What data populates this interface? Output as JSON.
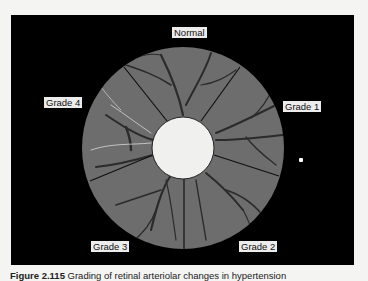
{
  "figure": {
    "segments": [
      {
        "label": "Normal"
      },
      {
        "label": "Grade 1"
      },
      {
        "label": "Grade 2"
      },
      {
        "label": "Grade 3"
      },
      {
        "label": "Grade 4"
      }
    ],
    "colors": {
      "panel_background": "#000000",
      "wheel_gray": "#6d6d6d",
      "center_disc": "#f0f0ee",
      "vessel": "#2a2a2a",
      "label_background": "#ececec"
    }
  },
  "caption": {
    "number": "Figure 2.115",
    "text": "Grading of retinal arteriolar changes in hypertension"
  }
}
